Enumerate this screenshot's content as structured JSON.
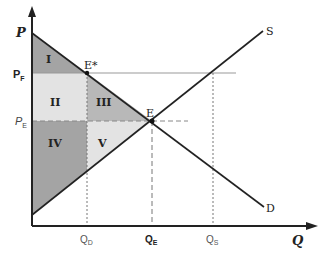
{
  "diagram": {
    "axes": {
      "y_label": "P",
      "x_label": "Q"
    },
    "price_labels": {
      "floor": "P",
      "floor_sub": "F",
      "equilibrium": "P",
      "equilibrium_sub": "E"
    },
    "quantity_labels": {
      "demanded": "Q",
      "demanded_sub": "D",
      "equilibrium": "Q",
      "equilibrium_sub": "E",
      "supplied": "Q",
      "supplied_sub": "S"
    },
    "curves": {
      "supply": "S",
      "demand": "D"
    },
    "points": {
      "equilibrium": "E",
      "floor_point": "E*"
    },
    "regions": [
      "I",
      "II",
      "III",
      "IV",
      "V"
    ],
    "colors": {
      "dark_region": "#a4a4a4",
      "light_region": "#e3e3e3",
      "line": "#222222",
      "guide": "#888888"
    }
  }
}
